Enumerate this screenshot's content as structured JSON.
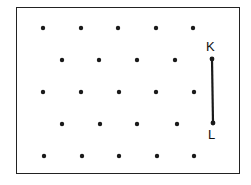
{
  "diagram": {
    "type": "dot-grid",
    "rows": [
      {
        "y": 28,
        "x": [
          43,
          81,
          118,
          156,
          193
        ]
      },
      {
        "y": 60,
        "x": [
          62,
          99,
          137,
          175
        ]
      },
      {
        "y": 92,
        "x": [
          43,
          81,
          119,
          156,
          194
        ]
      },
      {
        "y": 124,
        "x": [
          62,
          100,
          137,
          177
        ]
      },
      {
        "y": 156,
        "x": [
          44,
          82,
          119,
          157,
          194
        ]
      }
    ],
    "segment": {
      "from": {
        "label": "K",
        "x": 212,
        "y": 59
      },
      "to": {
        "label": "L",
        "x": 213,
        "y": 123
      }
    },
    "labels": {
      "k": "K",
      "l": "L"
    },
    "colors": {
      "dot": "#1a1a1a",
      "line": "#1a1a1a",
      "border": "#222222"
    }
  }
}
